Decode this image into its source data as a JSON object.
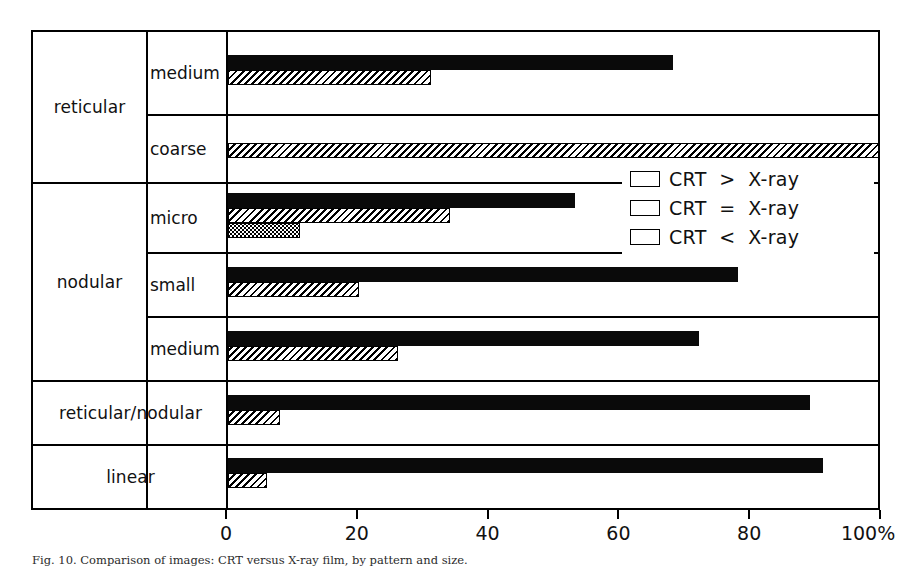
{
  "chart_data": {
    "type": "bar",
    "orientation": "horizontal",
    "title": "",
    "xlabel": "",
    "ylabel": "",
    "xlim": [
      0,
      100
    ],
    "xticks": [
      0,
      20,
      40,
      60,
      80,
      100
    ],
    "xtick_labels": [
      "0",
      "20",
      "40",
      "60",
      "80",
      "100%"
    ],
    "grid": false,
    "legend_position": "upper right",
    "categories": [
      "reticular / medium",
      "reticular / coarse",
      "nodular / micro",
      "nodular / small",
      "nodular / medium",
      "reticular/nodular",
      "linear"
    ],
    "series": [
      {
        "name": "CRT > X-ray",
        "fill": "solid-black",
        "values": [
          68,
          0,
          53,
          78,
          72,
          89,
          91
        ]
      },
      {
        "name": "CRT = X-ray",
        "fill": "diagonal-hatch",
        "values": [
          31,
          100,
          34,
          20,
          26,
          8,
          6
        ]
      },
      {
        "name": "CRT < X-ray",
        "fill": "dotted-stipple",
        "values": [
          0,
          0,
          11,
          0,
          0,
          0,
          0
        ]
      }
    ]
  },
  "axis": {
    "unit_suffix": "%",
    "ticks": [
      {
        "value": 0,
        "label": "0"
      },
      {
        "value": 20,
        "label": "20"
      },
      {
        "value": 40,
        "label": "40"
      },
      {
        "value": 60,
        "label": "60"
      },
      {
        "value": 80,
        "label": "80"
      },
      {
        "value": 100,
        "label": "100%"
      }
    ]
  },
  "groups": [
    {
      "label": "reticular",
      "span": 2,
      "spans_both_columns": false
    },
    {
      "label": "nodular",
      "span": 3,
      "spans_both_columns": false
    },
    {
      "label": "reticular/nodular",
      "span": 1,
      "spans_both_columns": true
    },
    {
      "label": "linear",
      "span": 1,
      "spans_both_columns": true
    }
  ],
  "subcategories": [
    {
      "label": "medium"
    },
    {
      "label": "coarse"
    },
    {
      "label": "micro"
    },
    {
      "label": "small"
    },
    {
      "label": "medium"
    },
    {
      "label": ""
    },
    {
      "label": ""
    }
  ],
  "rows": [
    {
      "name": "reticular-medium",
      "gt": 68,
      "eq": 31,
      "lt": 0
    },
    {
      "name": "reticular-coarse",
      "gt": 0,
      "eq": 100,
      "lt": 0
    },
    {
      "name": "nodular-micro",
      "gt": 53,
      "eq": 34,
      "lt": 11
    },
    {
      "name": "nodular-small",
      "gt": 78,
      "eq": 20,
      "lt": 0
    },
    {
      "name": "nodular-medium",
      "gt": 72,
      "eq": 26,
      "lt": 0
    },
    {
      "name": "reticular-nodular",
      "gt": 89,
      "eq": 8,
      "lt": 0
    },
    {
      "name": "linear",
      "gt": 91,
      "eq": 6,
      "lt": 0
    }
  ],
  "legend": {
    "items": [
      {
        "label": "CRT  >  X-ray",
        "fill": "solid-black"
      },
      {
        "label": "CRT  =  X-ray",
        "fill": "diagonal-hatch"
      },
      {
        "label": "CRT  <  X-ray",
        "fill": "dotted-stipple"
      }
    ]
  },
  "caption": {
    "text": "Fig. 10. Comparison of images: CRT versus X-ray film, by pattern and size."
  },
  "colors": {
    "ink": "#000000",
    "background": "#ffffff",
    "bar_solid": "#0a0a0a"
  }
}
